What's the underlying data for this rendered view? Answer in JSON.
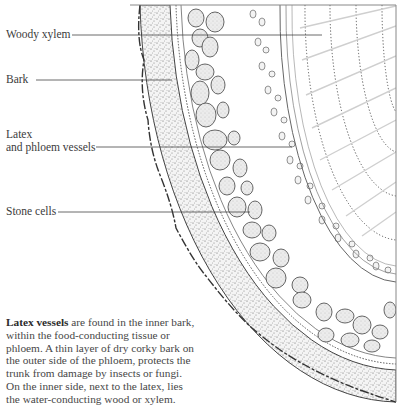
{
  "diagram": {
    "labels": [
      {
        "id": "woody-xylem",
        "text": "Woody xylem",
        "x": 6,
        "y": 28,
        "line_y": 35,
        "line_x1": 72,
        "line_x2": 322
      },
      {
        "id": "bark",
        "text": "Bark",
        "x": 6,
        "y": 73,
        "line_y": 80,
        "line_x1": 36,
        "line_x2": 172
      },
      {
        "id": "latex-phloem",
        "text_line1": "Latex",
        "text_line2": "and phloem vessels",
        "x": 6,
        "y": 129,
        "line_y": 147,
        "line_x1": 96,
        "line_x2": 292
      },
      {
        "id": "stone-cells",
        "text": "Stone cells",
        "x": 6,
        "y": 205,
        "line_y": 212,
        "line_x1": 58,
        "line_x2": 250
      }
    ],
    "caption": {
      "bold_lead": "Latex vessels",
      "rest": " are found in the inner bark, within the food-conducting tissue or phloem. A thin layer of dry corky bark on the outer side of the phloem, protects the trunk from damage by insects or fungi. On the inner side, next to the latex, lies the water-conducting wood or xylem."
    },
    "colors": {
      "ink": "#3a3a3a",
      "stipple": "#6a6a6a",
      "cell_fill": "#e9e9e9",
      "xylem_rays": "#c8c8c8",
      "background": "#ffffff"
    }
  }
}
